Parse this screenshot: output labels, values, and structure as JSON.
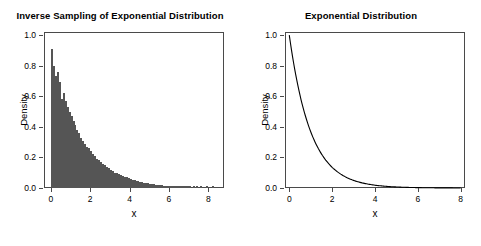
{
  "chart_data": [
    {
      "type": "bar",
      "panel": "left",
      "title": "Inverse Sampling of Exponential Distribution",
      "xlabel": "x",
      "ylabel": "Density",
      "xlim": [
        -0.35,
        8.8
      ],
      "ylim": [
        0,
        1.02
      ],
      "xticks": [
        0,
        2,
        4,
        6,
        8
      ],
      "xticklabels": [
        "0",
        "2",
        "4",
        "6",
        "8"
      ],
      "yticks": [
        0.0,
        0.2,
        0.4,
        0.6,
        0.8,
        1.0
      ],
      "yticklabels": [
        "0.0",
        "0.2",
        "0.4",
        "0.6",
        "0.8",
        "1.0"
      ],
      "grid": false,
      "legend": null,
      "bin_width": 0.1,
      "bin_starts": [
        0.0,
        0.1,
        0.2,
        0.3,
        0.4,
        0.5,
        0.6,
        0.7,
        0.8,
        0.9,
        1.0,
        1.1,
        1.2,
        1.3,
        1.4,
        1.5,
        1.6,
        1.7,
        1.8,
        1.9,
        2.0,
        2.1,
        2.2,
        2.3,
        2.4,
        2.5,
        2.6,
        2.7,
        2.8,
        2.9,
        3.0,
        3.1,
        3.2,
        3.3,
        3.4,
        3.5,
        3.6,
        3.7,
        3.8,
        3.9,
        4.0,
        4.1,
        4.2,
        4.3,
        4.4,
        4.5,
        4.6,
        4.7,
        4.8,
        4.9,
        5.0,
        5.1,
        5.2,
        5.3,
        5.4,
        5.5,
        5.6,
        5.7,
        5.8,
        5.9,
        6.0,
        6.1,
        6.2,
        6.3,
        6.4,
        6.5,
        6.6,
        6.7,
        6.8,
        6.9,
        7.0,
        7.2,
        7.4,
        7.6,
        7.9,
        8.2
      ],
      "values": [
        0.91,
        0.8,
        0.73,
        0.76,
        0.69,
        0.58,
        0.62,
        0.57,
        0.53,
        0.5,
        0.47,
        0.44,
        0.41,
        0.38,
        0.36,
        0.33,
        0.31,
        0.29,
        0.27,
        0.26,
        0.24,
        0.22,
        0.21,
        0.19,
        0.18,
        0.17,
        0.16,
        0.15,
        0.14,
        0.13,
        0.12,
        0.11,
        0.1,
        0.1,
        0.09,
        0.085,
        0.08,
        0.075,
        0.07,
        0.065,
        0.06,
        0.055,
        0.05,
        0.047,
        0.044,
        0.041,
        0.038,
        0.035,
        0.033,
        0.031,
        0.028,
        0.026,
        0.024,
        0.022,
        0.021,
        0.019,
        0.018,
        0.016,
        0.015,
        0.014,
        0.013,
        0.012,
        0.011,
        0.01,
        0.009,
        0.008,
        0.008,
        0.007,
        0.006,
        0.006,
        0.005,
        0.004,
        0.004,
        0.003,
        0.003,
        0.002
      ]
    },
    {
      "type": "line",
      "panel": "right",
      "title": "Exponential Distribution",
      "xlabel": "x",
      "ylabel": "Density",
      "xlim": [
        -0.2,
        8.2
      ],
      "ylim": [
        0,
        1.02
      ],
      "xticks": [
        0,
        2,
        4,
        6,
        8
      ],
      "xticklabels": [
        "0",
        "2",
        "4",
        "6",
        "8"
      ],
      "yticks": [
        0.0,
        0.2,
        0.4,
        0.6,
        0.8,
        1.0
      ],
      "yticklabels": [
        "0.0",
        "0.2",
        "0.4",
        "0.6",
        "0.8",
        "1.0"
      ],
      "grid": false,
      "legend": null,
      "series": [
        {
          "name": "dexp(x, rate = 1)",
          "color": "#000000",
          "x": [
            0.0,
            0.1,
            0.2,
            0.3,
            0.4,
            0.5,
            0.6,
            0.7,
            0.8,
            0.9,
            1.0,
            1.2,
            1.4,
            1.6,
            1.8,
            2.0,
            2.2,
            2.4,
            2.6,
            2.8,
            3.0,
            3.5,
            4.0,
            4.5,
            5.0,
            5.5,
            6.0,
            6.5,
            7.0,
            7.5,
            8.0
          ],
          "y": [
            1.0,
            0.905,
            0.819,
            0.741,
            0.67,
            0.607,
            0.549,
            0.497,
            0.449,
            0.407,
            0.368,
            0.301,
            0.247,
            0.202,
            0.165,
            0.135,
            0.111,
            0.091,
            0.074,
            0.061,
            0.05,
            0.03,
            0.018,
            0.011,
            0.0067,
            0.0041,
            0.0025,
            0.0015,
            0.0009,
            0.00055,
            0.00034
          ]
        }
      ]
    }
  ]
}
